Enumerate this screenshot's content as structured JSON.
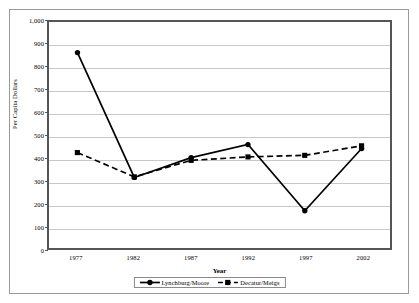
{
  "chart_data": {
    "type": "line",
    "title": "",
    "xlabel": "Year",
    "ylabel": "Per Capita Dollars",
    "categories": [
      "1977",
      "1982",
      "1987",
      "1992",
      "1997",
      "2002"
    ],
    "ylim": [
      0,
      1000
    ],
    "ytick_step": 100,
    "yticks": [
      "0",
      "100",
      "200",
      "300",
      "400",
      "500",
      "600",
      "700",
      "800",
      "900",
      "1,000"
    ],
    "grid": "horizontal",
    "legend_position": "bottom-center",
    "series": [
      {
        "name": "Lynchburg/Moore",
        "marker": "circle",
        "line_style": "solid",
        "color": "#000000",
        "values": [
          865,
          312,
          400,
          458,
          165,
          440
        ]
      },
      {
        "name": "Decatur/Meigs",
        "marker": "square",
        "line_style": "dashed",
        "color": "#000000",
        "values": [
          422,
          315,
          388,
          403,
          410,
          452
        ]
      }
    ]
  }
}
